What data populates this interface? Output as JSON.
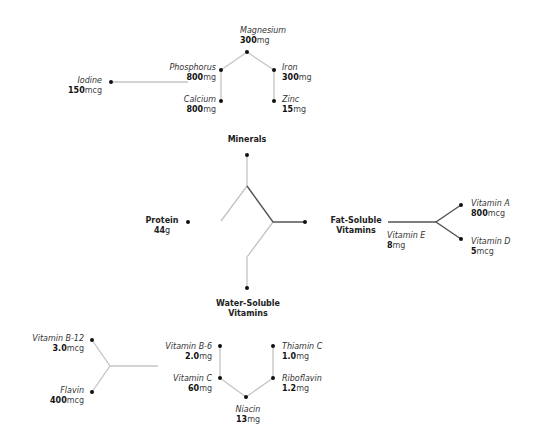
{
  "groups": {
    "minerals": "Minerals",
    "protein": {
      "name": "Protein",
      "num": "44",
      "unit": "g"
    },
    "fat_soluble": {
      "line1": "Fat-Soluble",
      "line2": "Vitamins"
    },
    "water_soluble": {
      "line1": "Water-Soluble",
      "line2": "Vitamins"
    }
  },
  "nutrients": {
    "magnesium": {
      "name": "Magnesium",
      "num": "300",
      "unit": "mg"
    },
    "phosphorus": {
      "name": "Phosphorus",
      "num": "800",
      "unit": "mg"
    },
    "iron": {
      "name": "Iron",
      "num": "300",
      "unit": "mg"
    },
    "calcium": {
      "name": "Calcium",
      "num": "800",
      "unit": "mg"
    },
    "zinc": {
      "name": "Zinc",
      "num": "15",
      "unit": "mg"
    },
    "iodine": {
      "name": "Iodine",
      "num": "150",
      "unit": "mcg"
    },
    "vitamin_a": {
      "name": "Vitamin A",
      "num": "800",
      "unit": "mcg"
    },
    "vitamin_d": {
      "name": "Vitamin D",
      "num": "5",
      "unit": "mcg"
    },
    "vitamin_e": {
      "name": "Vitamin E",
      "num": "8",
      "unit": "mg"
    },
    "vitamin_b12": {
      "name": "Vitamin B-12",
      "num": "3.0",
      "unit": "mcg"
    },
    "flavin": {
      "name": "Flavin",
      "num": "400",
      "unit": "mcg"
    },
    "vitamin_b6": {
      "name": "Vitamin B-6",
      "num": "2.0",
      "unit": "mg"
    },
    "vitamin_c": {
      "name": "Vitamin C",
      "num": "60",
      "unit": "mg"
    },
    "niacin": {
      "name": "Niacin",
      "num": "13",
      "unit": "mg"
    },
    "thiamin": {
      "name": "Thiamin C",
      "num": "1.0",
      "unit": "mg"
    },
    "riboflavin": {
      "name": "Riboflavin",
      "num": "1.2",
      "unit": "mg"
    }
  },
  "colors": {
    "edge_light": "#c4c4c4",
    "edge_dark": "#555555",
    "dot": "#111111"
  }
}
